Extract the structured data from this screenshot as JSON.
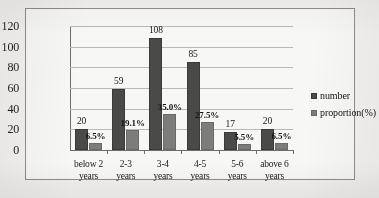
{
  "chart_data": {
    "type": "bar",
    "title": "",
    "subtitle": "",
    "xlabel": "",
    "ylabel": "",
    "ylim": [
      0,
      120
    ],
    "yticks": [
      0,
      20,
      40,
      60,
      80,
      100,
      120
    ],
    "ytick_labels": [
      "0",
      "20",
      "40",
      "60",
      "80",
      "100",
      "120"
    ],
    "grid": "horizontal",
    "legend_position": "right",
    "categories": [
      "below 2 years",
      "2-3 years",
      "3-4 years",
      "4-5 years",
      "5-6 years",
      "above 6 years"
    ],
    "category_lines": [
      [
        "below 2",
        "years"
      ],
      [
        "2-3",
        "years"
      ],
      [
        "3-4",
        "years"
      ],
      [
        "4-5",
        "years"
      ],
      [
        "5-6",
        "years"
      ],
      [
        "above 6",
        "years"
      ]
    ],
    "series": [
      {
        "name": "number",
        "color": "#4a4a48",
        "values": [
          20,
          59,
          108,
          85,
          17,
          20
        ],
        "data_labels": [
          "20",
          "59",
          "108",
          "85",
          "17",
          "20"
        ]
      },
      {
        "name": "proportion(%)",
        "color": "#7c7c7a",
        "values": [
          6.5,
          19.1,
          35.0,
          27.5,
          5.5,
          6.5
        ],
        "data_labels": [
          "6.5%",
          "19.1%",
          "35.0%",
          "27.5%",
          "5.5%",
          "6.5%"
        ]
      }
    ]
  },
  "legend": {
    "entries": [
      {
        "label": "number",
        "swatch": "legend-swatch-number"
      },
      {
        "label": "proportion(%)",
        "swatch": "legend-swatch-proportion"
      }
    ]
  },
  "colors": {
    "series_number": "#4a4a48",
    "series_proportion": "#7c7c7a",
    "gridline": "#b9b9b7",
    "axis": "#6e6e6c",
    "frame": "#8d8d8d",
    "plot_background": "#f7f7f5",
    "page_background": "#f2f1ef"
  }
}
